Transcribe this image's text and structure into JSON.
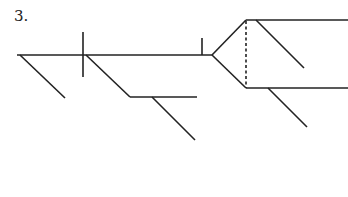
{
  "diagram": {
    "number_label": "3.",
    "type": "sentence-diagram",
    "line_color": "#222222"
  }
}
